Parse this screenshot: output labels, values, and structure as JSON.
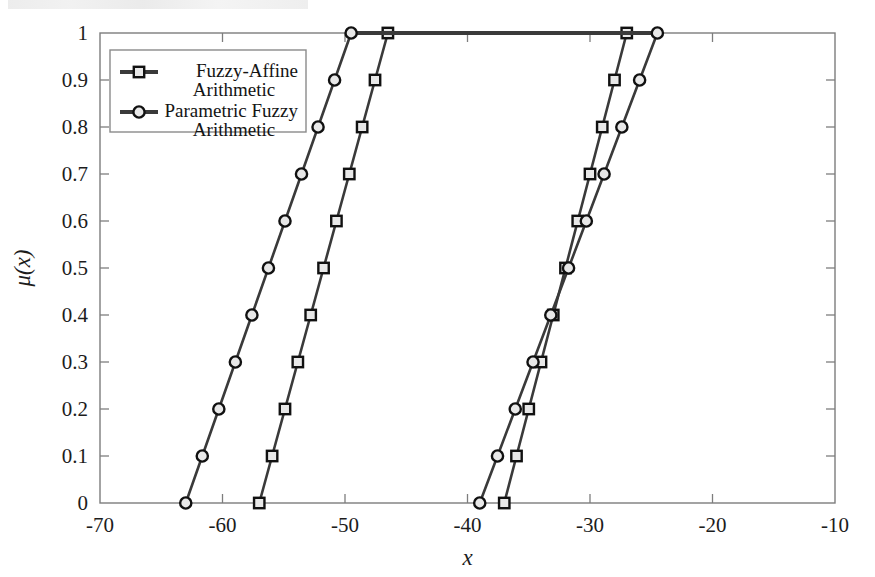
{
  "figure": {
    "background_color": "#ffffff",
    "axis_color": "#7d7d7d",
    "line_color": "#3a3a3a",
    "marker_edge_color": "#111111",
    "marker_face_color": "#e8e8e8"
  },
  "axes": {
    "x_label": "x",
    "y_label": "μ(x)",
    "x_ticks": [
      "-70",
      "-60",
      "-50",
      "-40",
      "-30",
      "-20",
      "-10"
    ],
    "x_tick_values": [
      -70,
      -60,
      -50,
      -40,
      -30,
      -20,
      -10
    ],
    "y_ticks": [
      "0",
      "0.1",
      "0.2",
      "0.3",
      "0.4",
      "0.5",
      "0.6",
      "0.7",
      "0.8",
      "0.9",
      "1"
    ],
    "y_tick_values": [
      0,
      0.1,
      0.2,
      0.3,
      0.4,
      0.5,
      0.6,
      0.7,
      0.8,
      0.9,
      1
    ]
  },
  "legend": {
    "position": "top-left-inside",
    "entries": [
      {
        "label_line1": "Fuzzy-Affine",
        "label_line2": "Arithmetic",
        "marker": "square"
      },
      {
        "label_line1": "Parametric Fuzzy",
        "label_line2": "Arithmetic",
        "marker": "circle"
      }
    ]
  },
  "chart_data": {
    "type": "line",
    "title": "",
    "xlabel": "x",
    "ylabel": "μ(x)",
    "xlim": [
      -70,
      -10
    ],
    "ylim": [
      0,
      1
    ],
    "grid": false,
    "legend_position": "upper left",
    "series": [
      {
        "name": "Fuzzy-Affine Arithmetic",
        "marker": "square",
        "x": [
          -57.0,
          -55.95,
          -54.9,
          -53.85,
          -52.8,
          -51.75,
          -50.7,
          -49.65,
          -48.6,
          -47.55,
          -46.5,
          -27.0,
          -28.0,
          -29.0,
          -30.0,
          -31.0,
          -32.0,
          -33.0,
          -34.0,
          -35.0,
          -36.0,
          -37.0
        ],
        "y": [
          0,
          0.1,
          0.2,
          0.3,
          0.4,
          0.5,
          0.6,
          0.7,
          0.8,
          0.9,
          1.0,
          1.0,
          0.9,
          0.8,
          0.7,
          0.6,
          0.5,
          0.4,
          0.3,
          0.2,
          0.1,
          0.0
        ],
        "left_branch": {
          "x": [
            -57.0,
            -55.95,
            -54.9,
            -53.85,
            -52.8,
            -51.75,
            -50.7,
            -49.65,
            -48.6,
            -47.55,
            -46.5
          ],
          "y": [
            0,
            0.1,
            0.2,
            0.3,
            0.4,
            0.5,
            0.6,
            0.7,
            0.8,
            0.9,
            1.0
          ]
        },
        "right_branch": {
          "x": [
            -27.0,
            -28.0,
            -29.0,
            -30.0,
            -31.0,
            -32.0,
            -33.0,
            -34.0,
            -35.0,
            -36.0,
            -37.0
          ],
          "y": [
            1.0,
            0.9,
            0.8,
            0.7,
            0.6,
            0.5,
            0.4,
            0.3,
            0.2,
            0.1,
            0.0
          ]
        },
        "plateau": {
          "x_start": -46.5,
          "x_end": -27.0,
          "y": 1.0
        },
        "support": [
          -57.0,
          -17.0
        ],
        "core": [
          -46.5,
          -27.0
        ]
      },
      {
        "name": "Parametric Fuzzy Arithmetic",
        "marker": "circle",
        "x": [
          -63.0,
          -61.65,
          -60.3,
          -58.95,
          -57.6,
          -56.25,
          -54.9,
          -53.55,
          -52.2,
          -50.85,
          -49.5,
          -24.5,
          -25.95,
          -27.4,
          -28.85,
          -30.3,
          -31.75,
          -33.2,
          -34.65,
          -36.1,
          -37.55,
          -39.0
        ],
        "y": [
          0,
          0.1,
          0.2,
          0.3,
          0.4,
          0.5,
          0.6,
          0.7,
          0.8,
          0.9,
          1.0,
          1.0,
          0.9,
          0.8,
          0.7,
          0.6,
          0.5,
          0.4,
          0.3,
          0.2,
          0.1,
          0.0
        ],
        "left_branch": {
          "x": [
            -63.0,
            -61.65,
            -60.3,
            -58.95,
            -57.6,
            -56.25,
            -54.9,
            -53.55,
            -52.2,
            -50.85,
            -49.5
          ],
          "y": [
            0,
            0.1,
            0.2,
            0.3,
            0.4,
            0.5,
            0.6,
            0.7,
            0.8,
            0.9,
            1.0
          ]
        },
        "right_branch": {
          "x": [
            -24.5,
            -25.95,
            -27.4,
            -28.85,
            -30.3,
            -31.75,
            -33.2,
            -34.65,
            -36.1,
            -37.55,
            -39.0
          ],
          "y": [
            1.0,
            0.9,
            0.8,
            0.7,
            0.6,
            0.5,
            0.4,
            0.3,
            0.2,
            0.1,
            0.0
          ]
        },
        "plateau": {
          "x_start": -49.5,
          "x_end": -24.5,
          "y": 1.0
        },
        "support": [
          -63.0,
          -10.0
        ],
        "core": [
          -49.5,
          -24.5
        ]
      }
    ]
  }
}
